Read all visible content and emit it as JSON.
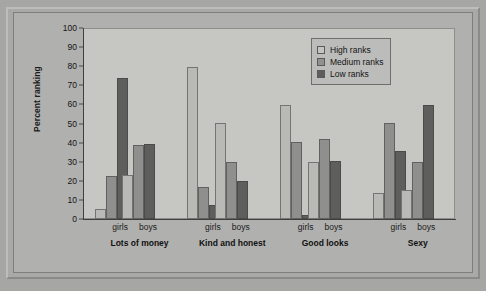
{
  "chart_data": {
    "type": "bar",
    "title": "",
    "subtitle": "",
    "xlabel": "",
    "ylabel": "Percent ranking",
    "ylim": [
      0,
      100
    ],
    "ytick_step": 10,
    "yticks": [
      "100",
      "90",
      "80",
      "70",
      "60",
      "50",
      "40",
      "30",
      "20",
      "10",
      "0"
    ],
    "grid": false,
    "legend_position": "top-right",
    "legend": [
      "High ranks",
      "Medium ranks",
      "Low ranks"
    ],
    "categories": [
      "Lots of money",
      "Kind and honest",
      "Good looks",
      "Sexy"
    ],
    "subcategories": [
      "girls",
      "boys"
    ],
    "groups": [
      {
        "category": "Lots of money",
        "subgroups": [
          {
            "name": "girls",
            "values": {
              "High ranks": 5.5,
              "Medium ranks": 22.5,
              "Low ranks": 74
            }
          },
          {
            "name": "boys",
            "values": {
              "High ranks": 23,
              "Medium ranks": 39,
              "Low ranks": 39.5
            }
          }
        ]
      },
      {
        "category": "Kind and honest",
        "subgroups": [
          {
            "name": "girls",
            "values": {
              "High ranks": 80,
              "Medium ranks": 17,
              "Low ranks": 7.5
            }
          },
          {
            "name": "boys",
            "values": {
              "High ranks": 50.5,
              "Medium ranks": 30,
              "Low ranks": 20
            }
          }
        ]
      },
      {
        "category": "Good looks",
        "subgroups": [
          {
            "name": "girls",
            "values": {
              "High ranks": 60,
              "Medium ranks": 40.5,
              "Low ranks": 2
            }
          },
          {
            "name": "boys",
            "values": {
              "High ranks": 30,
              "Medium ranks": 42,
              "Low ranks": 30.5
            }
          }
        ]
      },
      {
        "category": "Sexy",
        "subgroups": [
          {
            "name": "girls",
            "values": {
              "High ranks": 13.5,
              "Medium ranks": 50.5,
              "Low ranks": 36
            }
          },
          {
            "name": "boys",
            "values": {
              "High ranks": 15.5,
              "Medium ranks": 30,
              "Low ranks": 60
            }
          }
        ]
      }
    ],
    "series_colors": {
      "High ranks": "#b9b9b6",
      "Medium ranks": "#8f8f8d",
      "Low ranks": "#5e5e5c"
    }
  },
  "axis": {
    "y_title": "Percent ranking"
  },
  "legend": {
    "items": [
      {
        "label": "High ranks",
        "key": "High ranks"
      },
      {
        "label": "Medium ranks",
        "key": "Medium ranks"
      },
      {
        "label": "Low ranks",
        "key": "Low ranks"
      }
    ]
  }
}
